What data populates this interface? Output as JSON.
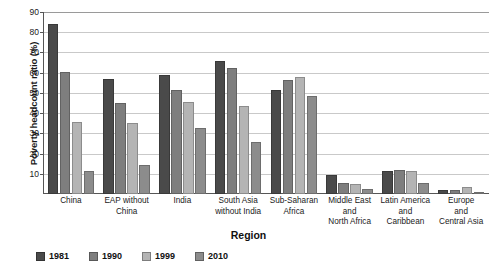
{
  "chart_data": {
    "type": "bar",
    "title": "",
    "xlabel": "Region",
    "ylabel": "Poverty headcount ratio (%)",
    "ylim": [
      0,
      90
    ],
    "yticks": [
      0,
      10,
      20,
      30,
      40,
      50,
      60,
      70,
      80,
      90
    ],
    "ytick_labels": [
      "",
      "10",
      "20",
      "30",
      "40",
      "50",
      "60",
      "70",
      "80",
      "90"
    ],
    "grid": true,
    "legend_position": "bottom-left",
    "categories": [
      "China",
      "EAP without China",
      "India",
      "South Asia without India",
      "Sub-Saharan Africa",
      "Middle East and North Africa",
      "Latin America and Caribbean",
      "Europe and Central Asia"
    ],
    "category_lines": [
      [
        "China"
      ],
      [
        "EAP without",
        "China"
      ],
      [
        "India"
      ],
      [
        "South Asia",
        "without India"
      ],
      [
        "Sub-Saharan",
        "Africa"
      ],
      [
        "Middle East",
        "and",
        "North Africa"
      ],
      [
        "Latin America",
        "and",
        "Caribbean"
      ],
      [
        "Europe",
        "and",
        "Central Asia"
      ]
    ],
    "series": [
      {
        "name": "1981",
        "color": "#4a4a4a",
        "values": [
          84.0,
          56.8,
          58.8,
          66.0,
          51.3,
          9.5,
          11.6,
          1.9
        ]
      },
      {
        "name": "1990",
        "color": "#7e7e7e",
        "values": [
          60.2,
          45.1,
          51.2,
          62.2,
          56.4,
          5.6,
          12.0,
          1.8
        ]
      },
      {
        "name": "1999",
        "color": "#b4b4b4",
        "values": [
          35.6,
          34.9,
          45.4,
          43.3,
          57.7,
          4.9,
          11.6,
          3.4
        ]
      },
      {
        "name": "2010",
        "color": "#8c8c8c",
        "values": [
          11.5,
          14.3,
          32.6,
          25.5,
          48.4,
          2.4,
          5.4,
          0.7
        ]
      }
    ]
  }
}
